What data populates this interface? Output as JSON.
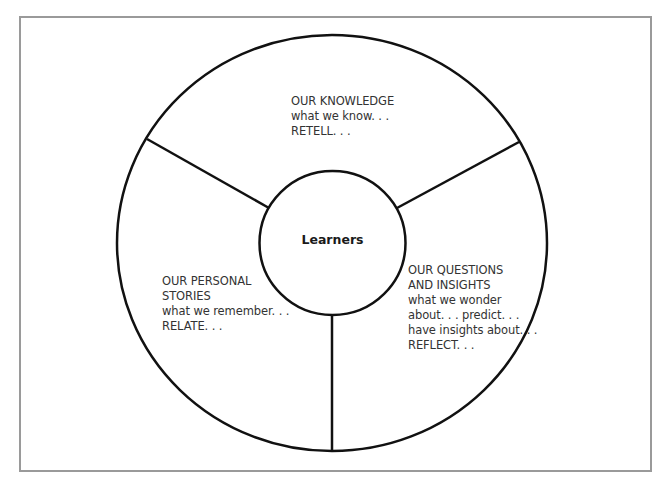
{
  "diagram": {
    "type": "concentric-circle-segments",
    "center": {
      "label": "Learners"
    },
    "segments": [
      {
        "position": "top",
        "lines": [
          "OUR KNOWLEDGE",
          "what we know. . .",
          "RETELL. . ."
        ]
      },
      {
        "position": "left",
        "lines": [
          "OUR PERSONAL",
          "STORIES",
          "what we remember. . .",
          "RELATE. . ."
        ]
      },
      {
        "position": "right",
        "lines": [
          "OUR QUESTIONS",
          "AND INSIGHTS",
          "what we wonder",
          "about. . .  predict. . .",
          "have insights about. . .",
          "REFLECT. . ."
        ]
      }
    ],
    "colors": {
      "stroke": "#111111",
      "text": "#333333",
      "frame": "#9a9a9a",
      "background": "#ffffff"
    }
  }
}
